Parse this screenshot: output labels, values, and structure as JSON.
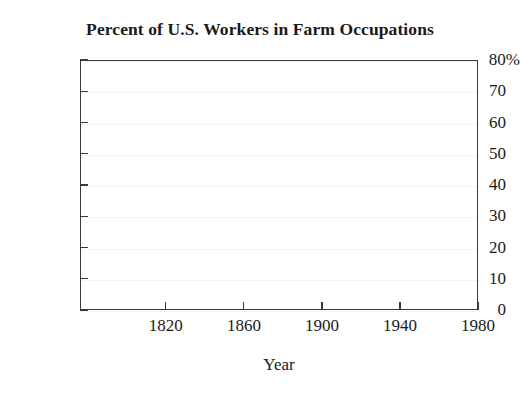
{
  "chart_data": {
    "type": "line",
    "title": "Percent of U.S. Workers in Farm Occupations",
    "xlabel": "Year",
    "ylabel": "",
    "xlim": [
      1776,
      1980
    ],
    "ylim": [
      0,
      80
    ],
    "grid": true,
    "legend": false,
    "legend_position": "none",
    "x_ticks": [
      {
        "value": 1820,
        "label": "1820"
      },
      {
        "value": 1860,
        "label": "1860"
      },
      {
        "value": 1900,
        "label": "1900"
      },
      {
        "value": 1940,
        "label": "1940"
      },
      {
        "value": 1980,
        "label": "1980"
      }
    ],
    "y_ticks": [
      {
        "value": 80,
        "label": "80",
        "suffix": "%"
      },
      {
        "value": 70,
        "label": "70",
        "suffix": ""
      },
      {
        "value": 60,
        "label": "60",
        "suffix": ""
      },
      {
        "value": 50,
        "label": "50",
        "suffix": ""
      },
      {
        "value": 40,
        "label": "40",
        "suffix": ""
      },
      {
        "value": 30,
        "label": "30",
        "suffix": ""
      },
      {
        "value": 20,
        "label": "20",
        "suffix": ""
      },
      {
        "value": 10,
        "label": "10",
        "suffix": ""
      },
      {
        "value": 0,
        "label": "0",
        "suffix": ""
      }
    ],
    "series": [],
    "annotations": [],
    "note": "Empty plotting region: axes, ticks and gridlines are drawn but no data series is plotted."
  },
  "colors": {
    "background": "#ffffff",
    "axis": "#3a3a3a",
    "text": "#1a1a1a",
    "gridline": "#f4f4f6"
  }
}
